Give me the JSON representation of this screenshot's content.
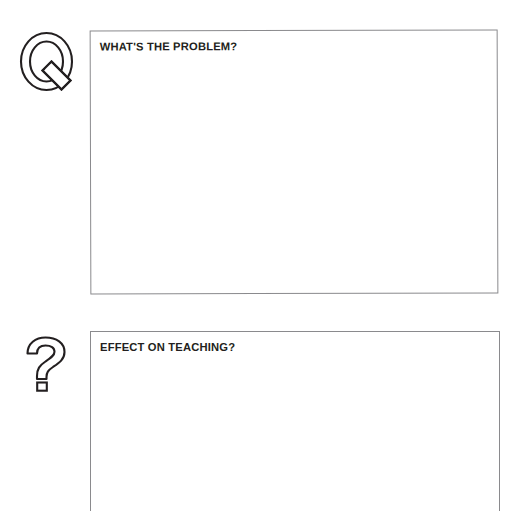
{
  "document": {
    "type": "worksheet",
    "background_color": "#ffffff",
    "ink_color": "#231f20",
    "border_color": "#8a8a8d"
  },
  "sections": [
    {
      "id": "problem",
      "icon_name": "letter-q-outline-icon",
      "icon_glyph": "Q",
      "prompt": "WHAT'S THE PROBLEM?",
      "response_value": "",
      "response_placeholder": ""
    },
    {
      "id": "effect",
      "icon_name": "question-mark-outline-icon",
      "icon_glyph": "?",
      "prompt": "EFFECT ON TEACHING?",
      "response_value": "",
      "response_placeholder": ""
    }
  ]
}
